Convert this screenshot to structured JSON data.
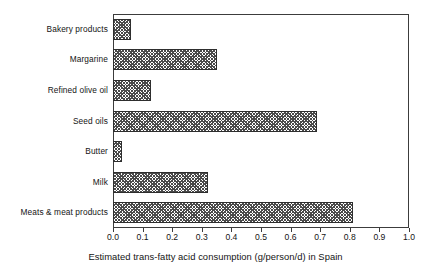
{
  "chart_data": {
    "type": "bar",
    "orientation": "horizontal",
    "title": "",
    "xlabel": "Estimated trans-fatty acid consumption (g/person/d) in Spain",
    "ylabel": "",
    "xlim": [
      0.0,
      1.0
    ],
    "grid": false,
    "legend": null,
    "categories": [
      "Bakery products",
      "Margarine",
      "Refined olive oil",
      "Seed oils",
      "Butter",
      "Milk",
      "Meats & meat products"
    ],
    "values": [
      0.06,
      0.35,
      0.13,
      0.69,
      0.03,
      0.32,
      0.81
    ],
    "xticks": [
      "0.0",
      "0.1",
      "0.2",
      "0.3",
      "0.4",
      "0.5",
      "0.6",
      "0.7",
      "0.8",
      "0.9",
      "1.0"
    ],
    "xtick_values": [
      0.0,
      0.1,
      0.2,
      0.3,
      0.4,
      0.5,
      0.6,
      0.7,
      0.8,
      0.9,
      1.0
    ],
    "bar_fill": "crosshatch",
    "bar_edge_color": "#2e2e2e",
    "axis_color": "#3c3c3c",
    "background_color": "#ffffff"
  }
}
